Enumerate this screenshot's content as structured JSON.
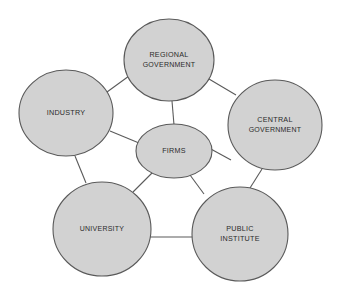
{
  "diagram": {
    "style": {
      "node_fill": "#d2d2d2",
      "node_stroke": "#5a5a5a",
      "edge_stroke": "#5a5a5a",
      "label_color": "#2b2b2b",
      "background": "#ffffff"
    },
    "nodes": [
      {
        "id": "regional-government",
        "label_line1": "REGIONAL",
        "label_line2": "GOVERNMENT",
        "shape": "circle",
        "cx": 169,
        "cy": 60,
        "rx": 45,
        "ry": 41
      },
      {
        "id": "industry",
        "label_line1": "INDUSTRY",
        "label_line2": "",
        "shape": "circle",
        "cx": 66,
        "cy": 113,
        "rx": 47,
        "ry": 43
      },
      {
        "id": "central-government",
        "label_line1": "CENTRAL",
        "label_line2": "GOVERNMENT",
        "shape": "circle",
        "cx": 275,
        "cy": 125,
        "rx": 47,
        "ry": 45
      },
      {
        "id": "firms",
        "label_line1": "FIRMS",
        "label_line2": "",
        "shape": "ellipse",
        "cx": 174,
        "cy": 151,
        "rx": 38,
        "ry": 27
      },
      {
        "id": "university",
        "label_line1": "UNIVERSITY",
        "label_line2": "",
        "shape": "circle",
        "cx": 102,
        "cy": 229,
        "rx": 49,
        "ry": 47
      },
      {
        "id": "public-institute",
        "label_line1": "PUBLIC",
        "label_line2": "INSTITUTE",
        "shape": "circle",
        "cx": 240,
        "cy": 234,
        "rx": 48,
        "ry": 47
      }
    ],
    "edges": [
      {
        "id": "industry--regional-government",
        "from": "industry",
        "to": "regional-government",
        "x1": 107,
        "y1": 92,
        "x2": 129,
        "y2": 76
      },
      {
        "id": "regional-government--central-government",
        "from": "regional-government",
        "to": "central-government",
        "x1": 209,
        "y1": 79,
        "x2": 236,
        "y2": 95
      },
      {
        "id": "regional-government--firms",
        "from": "regional-government",
        "to": "firms",
        "x1": 172,
        "y1": 101,
        "x2": 174,
        "y2": 125
      },
      {
        "id": "industry--firms",
        "from": "industry",
        "to": "firms",
        "x1": 110,
        "y1": 131,
        "x2": 139,
        "y2": 143
      },
      {
        "id": "central-government--firms",
        "from": "central-government",
        "to": "firms",
        "x1": 231,
        "y1": 160,
        "x2": 209,
        "y2": 148
      },
      {
        "id": "industry--university",
        "from": "industry",
        "to": "university",
        "x1": 75,
        "y1": 156,
        "x2": 86,
        "y2": 183
      },
      {
        "id": "central-government--public-institute",
        "from": "central-government",
        "to": "public-institute",
        "x1": 262,
        "y1": 169,
        "x2": 250,
        "y2": 188
      },
      {
        "id": "firms--university",
        "from": "firms",
        "to": "university",
        "x1": 152,
        "y1": 173,
        "x2": 133,
        "y2": 192
      },
      {
        "id": "firms--public-institute",
        "from": "firms",
        "to": "public-institute",
        "x1": 190,
        "y1": 175,
        "x2": 204,
        "y2": 194
      },
      {
        "id": "university--public-institute",
        "from": "university",
        "to": "public-institute",
        "x1": 150,
        "y1": 237,
        "x2": 193,
        "y2": 237
      }
    ]
  }
}
